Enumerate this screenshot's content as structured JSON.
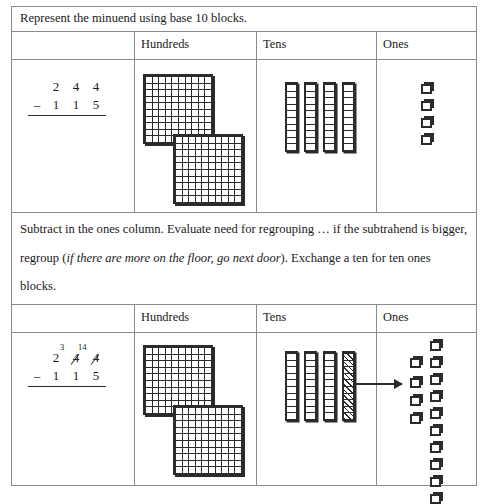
{
  "worksheet": {
    "title": "Base 10 Blocks Subtraction Worksheet",
    "steps": [
      {
        "id": "step-1",
        "instruction": "Represent the minuend using base 10 blocks.",
        "columns": {
          "hundreds": "Hundreds",
          "tens": "Tens",
          "ones": "Ones"
        },
        "problem": {
          "minus_sign": "–",
          "minuend_digits": [
            "2",
            "4",
            "4"
          ],
          "subtrahend_digits": [
            "1",
            "1",
            "5"
          ],
          "minuend": "244",
          "subtrahend": "115",
          "regrouped": false
        },
        "blocks": {
          "hundreds_flats": 2,
          "tens_rods": 4,
          "tens_rods_crossed": 0,
          "ones_cubes": 4,
          "ones_exchanged_cubes": 0,
          "exchange_arrow": false
        }
      },
      {
        "id": "step-2",
        "instruction_parts": {
          "before": "Subtract in the ones column. Evaluate need for regrouping … if the subtrahend is bigger, regroup (",
          "italic": "if there are more on the floor, go next door",
          "after": "). Exchange a ten for ten ones blocks."
        },
        "columns": {
          "hundreds": "Hundreds",
          "tens": "Tens",
          "ones": "Ones"
        },
        "problem": {
          "minus_sign": "–",
          "minuend_digits": [
            "2",
            "4",
            "4"
          ],
          "subtrahend_digits": [
            "1",
            "1",
            "5"
          ],
          "minuend": "244",
          "subtrahend": "115",
          "regrouped": true,
          "tens_crossed_out": "4",
          "tens_regrouped_value": "3",
          "ones_crossed_out": "4",
          "ones_regrouped_value": "14"
        },
        "blocks": {
          "hundreds_flats": 2,
          "tens_rods": 4,
          "tens_rods_crossed": 1,
          "ones_cubes": 4,
          "ones_exchanged_cubes": 10,
          "exchange_arrow": true
        }
      }
    ],
    "colors": {
      "border": "#8a8a8a",
      "ink": "#2b2b2b",
      "paper": "#ffffff"
    }
  }
}
